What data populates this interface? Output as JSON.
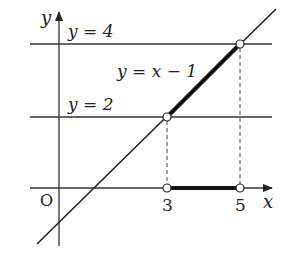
{
  "diagram": {
    "axes": {
      "x_label": "x",
      "y_label": "y",
      "origin_label": "O"
    },
    "lines": {
      "main": {
        "label": "y = x − 1",
        "slope": 1,
        "intercept": -1
      },
      "upper": {
        "label": "y = 4",
        "y": 4
      },
      "lower": {
        "label": "y = 2",
        "y": 2
      }
    },
    "x_ticks": [
      {
        "value": 3,
        "label": "3"
      },
      {
        "value": 5,
        "label": "5"
      }
    ],
    "open_points": [
      {
        "x": 3,
        "y": 2
      },
      {
        "x": 5,
        "y": 4
      },
      {
        "x": 3,
        "y": 0
      },
      {
        "x": 5,
        "y": 0
      }
    ],
    "highlighted_segments": [
      {
        "from": [
          3,
          2
        ],
        "to": [
          5,
          4
        ],
        "description": "thick segment of y = x − 1"
      },
      {
        "from": [
          3,
          0
        ],
        "to": [
          5,
          0
        ],
        "description": "thick segment on x-axis"
      }
    ],
    "colors": {
      "line": "#222222",
      "background": "#ffffff"
    }
  }
}
